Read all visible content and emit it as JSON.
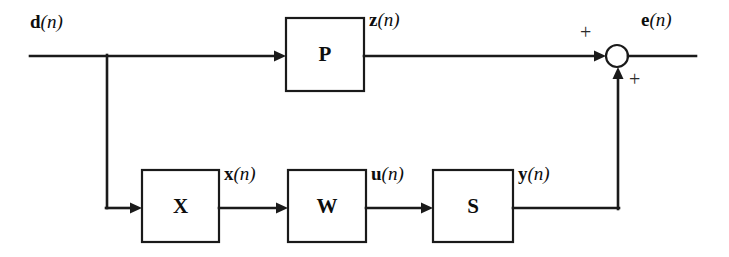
{
  "diagram": {
    "type": "signal-flow block diagram",
    "background_color": "#ffffff",
    "line_color": "#1a1a1a",
    "blocks": [
      {
        "id": "P",
        "label": "P",
        "x": 286,
        "y": 18,
        "w": 78,
        "h": 73
      },
      {
        "id": "X",
        "label": "X",
        "x": 142,
        "y": 170,
        "w": 77,
        "h": 72
      },
      {
        "id": "W",
        "label": "W",
        "x": 288,
        "y": 170,
        "w": 78,
        "h": 72
      },
      {
        "id": "S",
        "label": "S",
        "x": 433,
        "y": 170,
        "w": 80,
        "h": 72
      }
    ],
    "signals": [
      {
        "id": "d",
        "symbol": "d",
        "index": "(n)",
        "x": 30,
        "y": 12
      },
      {
        "id": "z",
        "symbol": "z",
        "index": "(n)",
        "x": 369,
        "y": 10
      },
      {
        "id": "e",
        "symbol": "e",
        "index": "(n)",
        "x": 641,
        "y": 10
      },
      {
        "id": "x",
        "symbol": "x",
        "index": "(n)",
        "x": 224,
        "y": 164
      },
      {
        "id": "u",
        "symbol": "u",
        "index": "(n)",
        "x": 371,
        "y": 164
      },
      {
        "id": "y",
        "symbol": "y",
        "index": "(n)",
        "x": 518,
        "y": 164
      }
    ],
    "summing_junction": {
      "id": "sum",
      "center_x": 617,
      "center_y": 56,
      "radius": 11,
      "signs": [
        {
          "id": "sign-top",
          "symbol": "+",
          "x": 580,
          "y": 22
        },
        {
          "id": "sign-bottom",
          "symbol": "+",
          "x": 629,
          "y": 69
        }
      ]
    }
  }
}
